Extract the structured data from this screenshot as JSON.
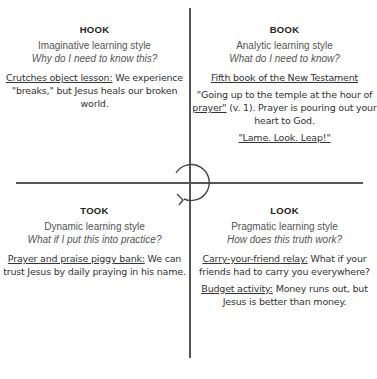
{
  "quadrants": {
    "hook": {
      "title": "HOOK",
      "style": "Imaginative learning style",
      "question": "Why do I need to know this?",
      "notes": [
        {
          "underlined": "Crutches object lesson:",
          "text": " We experience \"breaks,\" but Jesus heals our broken world."
        }
      ]
    },
    "book": {
      "title": "BOOK",
      "style": "Analytic learning style",
      "question": "What do I need to know?",
      "notes": [
        {
          "underlined": "Fifth book of the New Testament",
          "text": ""
        },
        {
          "pre": "\"Going up to the temple at the hour of ",
          "underlined": "prayer\"",
          "text": " (v. 1). Prayer is pouring out your heart to God."
        },
        {
          "underlined": "\"Lame. Look. Leap!\"",
          "text": ""
        }
      ]
    },
    "took": {
      "title": "TOOK",
      "style": "Dynamic learning style",
      "question": "What if I put this into practice?",
      "notes": [
        {
          "underlined": "Prayer and praise piggy bank:",
          "text": " We can trust Jesus by daily praying in his name."
        }
      ]
    },
    "look": {
      "title": "LOOK",
      "style": "Pragmatic learning style",
      "question": "How does this truth work?",
      "notes": [
        {
          "underlined": "Carry-your-friend relay:",
          "text": " What if your friends had to carry you everywhere?"
        },
        {
          "underlined": "Budget activity:",
          "text": " Money runs out, but Jesus is better than money."
        }
      ]
    }
  },
  "center": {
    "icon": "cycle-arrow-icon"
  },
  "colors": {
    "line": "#555555",
    "text": "#3a3a3a"
  }
}
